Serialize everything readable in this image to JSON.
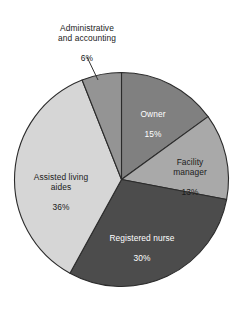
{
  "chart_data": {
    "type": "pie",
    "title": "",
    "subtitle": "",
    "xlabel": "",
    "ylabel": "",
    "legend_position": "none",
    "grid": false,
    "units": "percent",
    "categories": [
      "Owner",
      "Facility manager",
      "Registered nurse",
      "Assisted living aides",
      "Administrative and accounting"
    ],
    "values": [
      15,
      13,
      30,
      36,
      6
    ],
    "value_labels": [
      "15%",
      "13%",
      "30%",
      "36%",
      "6%"
    ],
    "colors": [
      "#808080",
      "#a9a9a9",
      "#4c4c4c",
      "#d6d6d6",
      "#949494"
    ],
    "start_angle_deg": 0,
    "direction": "clockwise",
    "slices": [
      {
        "name": "Owner",
        "label_lines": "Owner",
        "value": 15,
        "value_label": "15%",
        "color": "#808080",
        "label_placement": "inside",
        "label_text_color": "#ffffff",
        "start_deg": 0,
        "end_deg": 54
      },
      {
        "name": "Facility manager",
        "label_lines": "Facility\nmanager",
        "value": 13,
        "value_label": "13%",
        "color": "#a9a9a9",
        "label_placement": "inside",
        "label_text_color": "#1a1a1a",
        "start_deg": 54,
        "end_deg": 100.8
      },
      {
        "name": "Registered nurse",
        "label_lines": "Registered nurse",
        "value": 30,
        "value_label": "30%",
        "color": "#4c4c4c",
        "label_placement": "inside",
        "label_text_color": "#ffffff",
        "start_deg": 100.8,
        "end_deg": 208.8
      },
      {
        "name": "Assisted living aides",
        "label_lines": "Assisted living\naides",
        "value": 36,
        "value_label": "36%",
        "color": "#d6d6d6",
        "label_placement": "inside",
        "label_text_color": "#1a1a1a",
        "start_deg": 208.8,
        "end_deg": 338.4
      },
      {
        "name": "Administrative and accounting",
        "label_lines": "Administrative\nand accounting",
        "value": 6,
        "value_label": "6%",
        "color": "#949494",
        "label_placement": "outside-with-leader",
        "label_text_color": "#1a1a1a",
        "start_deg": 338.4,
        "end_deg": 360
      }
    ]
  },
  "labels": {
    "admin": {
      "name": "Administrative\nand accounting",
      "value": "6%"
    },
    "owner": {
      "name": "Owner",
      "value": "15%"
    },
    "facility": {
      "name": "Facility\nmanager",
      "value": "13%"
    },
    "nurse": {
      "name": "Registered nurse",
      "value": "30%"
    },
    "aides": {
      "name": "Assisted living\naides",
      "value": "36%"
    }
  }
}
